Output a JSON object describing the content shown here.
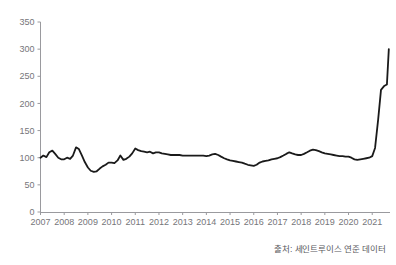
{
  "chart_data": {
    "type": "line",
    "title": "",
    "subtitle": "",
    "xlabel": "",
    "ylabel": "",
    "ylim": [
      0,
      350
    ],
    "yticks": [
      0,
      50,
      100,
      150,
      200,
      250,
      300,
      350
    ],
    "xlim": [
      2007.0,
      2021.75
    ],
    "xticks": [
      2007,
      2008,
      2009,
      2010,
      2011,
      2012,
      2013,
      2014,
      2015,
      2016,
      2017,
      2018,
      2019,
      2020,
      2021
    ],
    "xtick_labels": [
      "2007",
      "2008",
      "2009",
      "2010",
      "2011",
      "2012",
      "2013",
      "2014",
      "2015",
      "2016",
      "2017",
      "2018",
      "2019",
      "2020",
      "2021"
    ],
    "grid": false,
    "legend": null,
    "line_color": "#1a1a1a",
    "line_width": 1.8,
    "series": [
      {
        "name": "index",
        "x": [
          2007.0,
          2007.12,
          2007.25,
          2007.37,
          2007.5,
          2007.62,
          2007.75,
          2007.87,
          2008.0,
          2008.12,
          2008.25,
          2008.37,
          2008.5,
          2008.62,
          2008.75,
          2008.87,
          2009.0,
          2009.12,
          2009.25,
          2009.37,
          2009.5,
          2009.62,
          2009.75,
          2009.87,
          2010.0,
          2010.12,
          2010.25,
          2010.37,
          2010.5,
          2010.62,
          2010.75,
          2010.87,
          2011.0,
          2011.12,
          2011.25,
          2011.37,
          2011.5,
          2011.62,
          2011.75,
          2011.87,
          2012.0,
          2012.12,
          2012.25,
          2012.37,
          2012.5,
          2012.62,
          2012.75,
          2012.87,
          2013.0,
          2013.12,
          2013.25,
          2013.37,
          2013.5,
          2013.62,
          2013.75,
          2013.87,
          2014.0,
          2014.12,
          2014.25,
          2014.37,
          2014.5,
          2014.62,
          2014.75,
          2014.87,
          2015.0,
          2015.12,
          2015.25,
          2015.37,
          2015.5,
          2015.62,
          2015.75,
          2015.87,
          2016.0,
          2016.12,
          2016.25,
          2016.37,
          2016.5,
          2016.62,
          2016.75,
          2016.87,
          2017.0,
          2017.12,
          2017.25,
          2017.37,
          2017.5,
          2017.62,
          2017.75,
          2017.87,
          2018.0,
          2018.12,
          2018.25,
          2018.37,
          2018.5,
          2018.62,
          2018.75,
          2018.87,
          2019.0,
          2019.12,
          2019.25,
          2019.37,
          2019.5,
          2019.62,
          2019.75,
          2019.87,
          2020.0,
          2020.12,
          2020.25,
          2020.37,
          2020.5,
          2020.62,
          2020.75,
          2020.87,
          2021.0,
          2021.12,
          2021.25,
          2021.37,
          2021.5,
          2021.62,
          2021.7
        ],
        "y": [
          100,
          104,
          101,
          110,
          113,
          107,
          100,
          97,
          97,
          100,
          98,
          104,
          119,
          116,
          104,
          92,
          82,
          76,
          74,
          75,
          80,
          84,
          87,
          91,
          91,
          90,
          95,
          104,
          96,
          98,
          102,
          108,
          117,
          114,
          112,
          111,
          110,
          111,
          108,
          110,
          110,
          108,
          107,
          106,
          105,
          105,
          105,
          105,
          104,
          104,
          104,
          104,
          104,
          104,
          104,
          104,
          103,
          104,
          106,
          107,
          105,
          102,
          99,
          97,
          95,
          94,
          93,
          92,
          91,
          89,
          87,
          86,
          85,
          87,
          91,
          93,
          94,
          95,
          97,
          98,
          99,
          101,
          104,
          107,
          110,
          108,
          106,
          105,
          105,
          107,
          110,
          113,
          115,
          114,
          112,
          110,
          108,
          107,
          106,
          105,
          104,
          103,
          103,
          102,
          102,
          100,
          97,
          96,
          97,
          98,
          99,
          100,
          103,
          118,
          170,
          225,
          232,
          235,
          300
        ]
      }
    ],
    "annotations": {
      "source": "출처: 세인트루이스 연준 데이터"
    }
  },
  "figure": {
    "source_note": "출처: 세인트루이스 연준 데이터",
    "background_color": "#ffffff",
    "axis_color": "#9a9a9e",
    "tick_text_color": "#76767a"
  }
}
